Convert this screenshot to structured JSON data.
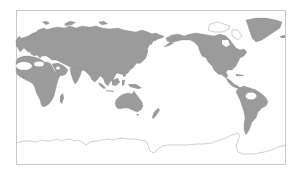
{
  "map": {
    "type": "world-map",
    "projection": "equirectangular, Pacific-centered (0°–360° longitude)",
    "colors": {
      "land": "#9b9b9b",
      "ocean": "#ffffff",
      "frame": "#c8c8c8",
      "antarctica_outline": "#b0b0b0",
      "unshaded_regions": "#ffffff"
    },
    "regions_shaded": [
      "Europe",
      "Asia",
      "Africa",
      "Australia",
      "North America",
      "South America",
      "Greenland",
      "New Zealand",
      "Japan",
      "Indonesia"
    ],
    "regions_unshaded": [
      "Sahara",
      "Arabian Peninsula",
      "Amazon basin",
      "Antarctica",
      "Canadian Arctic Archipelago"
    ]
  }
}
